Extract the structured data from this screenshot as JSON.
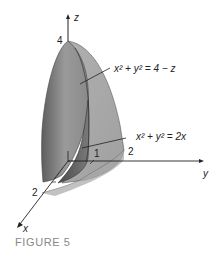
{
  "figure": {
    "caption": "FIGURE 5",
    "axes": {
      "z_label": "z",
      "y_label": "y",
      "x_label": "x",
      "z_tick": "4",
      "x_tick": "2",
      "y_tick_1": "1",
      "y_tick_2": "2"
    },
    "annotations": {
      "paraboloid_eq": "x² + y² = 4 − z",
      "cylinder_eq": "x² + y² = 2x"
    },
    "colors": {
      "surface_dark": "#6e6e6e",
      "surface_mid": "#9a9a9a",
      "surface_light": "#bdbdbd",
      "axis": "#222222",
      "caption": "#888888"
    }
  }
}
